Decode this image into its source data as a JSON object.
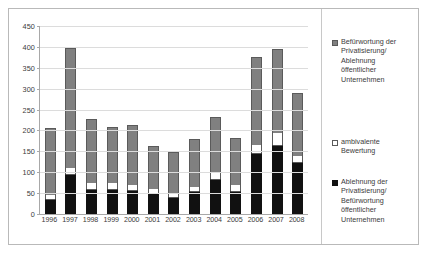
{
  "chart_data": {
    "type": "bar",
    "stacked": true,
    "title": "",
    "subtitle": "",
    "xlabel": "",
    "ylabel": "",
    "ylim": [
      0,
      450
    ],
    "ytick_step": 50,
    "yticks": [
      450,
      400,
      350,
      300,
      250,
      200,
      150,
      100,
      50,
      0
    ],
    "grid": true,
    "legend_position": "right",
    "categories": [
      "1996",
      "1997",
      "1998",
      "1999",
      "2000",
      "2001",
      "2002",
      "2003",
      "2004",
      "2005",
      "2006",
      "2007",
      "2008"
    ],
    "series": [
      {
        "name": "Ablehnung der Privatisierung/ Befürwortung öffentlicher Unternehmen",
        "color": "#111111",
        "values": [
          35,
          95,
          60,
          60,
          58,
          50,
          40,
          55,
          85,
          55,
          145,
          165,
          125
        ]
      },
      {
        "name": "ambivalente Bewertung",
        "color": "#ffffff",
        "values": [
          10,
          15,
          15,
          15,
          12,
          10,
          10,
          10,
          15,
          15,
          20,
          30,
          15
        ]
      },
      {
        "name": "Befürwortung der Privatisierung/ Ablehnung öffentlicher Unternehmen",
        "color": "#808080",
        "values": [
          160,
          288,
          153,
          133,
          143,
          102,
          98,
          115,
          133,
          112,
          210,
          200,
          150
        ]
      }
    ],
    "totals": [
      205,
      398,
      228,
      208,
      213,
      162,
      148,
      180,
      233,
      182,
      375,
      395,
      290
    ]
  },
  "legend": {
    "items": [
      {
        "marker": "gray-square",
        "lines": [
          "Befürwortung der",
          "Privatisierung/",
          "Ablehnung",
          "öffentlicher",
          "Unternehmen"
        ]
      },
      {
        "marker": "white-square",
        "lines": [
          "ambivalente",
          "Bewertung"
        ]
      },
      {
        "marker": "black-square",
        "lines": [
          "Ablehnung der",
          "Privatisierung/",
          "Befürwortung",
          "öffentlicher",
          "Unternehmen"
        ]
      }
    ]
  }
}
